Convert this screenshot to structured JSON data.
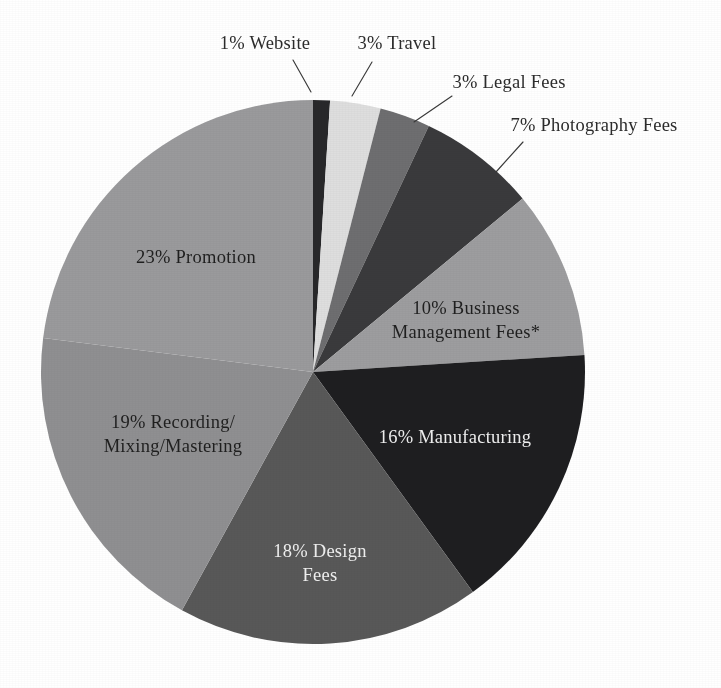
{
  "figure": {
    "background_color": "#ffffff",
    "width": 721,
    "height": 688
  },
  "pie_geometry": {
    "center_x": 313,
    "center_y": 372,
    "radius": 272,
    "start_angle_deg": 0,
    "direction": "clockwise"
  },
  "chart_data": {
    "type": "pie",
    "title": "",
    "subtitle": "",
    "xlabel": "",
    "ylabel": "",
    "legend_position": "none",
    "grid": false,
    "units": "percent",
    "total": 100,
    "footnote_marker": "*",
    "categories": [
      "Website",
      "Travel",
      "Legal Fees",
      "Photography Fees",
      "Business Management Fees*",
      "Manufacturing",
      "Design Fees",
      "Recording/Mixing/Mastering",
      "Promotion"
    ],
    "values": [
      1,
      3,
      3,
      7,
      10,
      16,
      18,
      19,
      23
    ],
    "colors": [
      "#28282a",
      "#dedede",
      "#6e6e70",
      "#3a3a3c",
      "#9d9d9f",
      "#1e1e20",
      "#585858",
      "#8f8f91",
      "#9a9a9c"
    ],
    "slices": [
      {
        "label": "Website",
        "value": 1,
        "value_text": "1%",
        "full_label": "1% Website",
        "color": "#28282a",
        "label_placement": "outside",
        "label_lines": [
          "1% Website"
        ],
        "label_x": 265,
        "label_y": 45,
        "label_anchor": "middle",
        "leader": {
          "x1": 293,
          "y1": 60,
          "x2": 311,
          "y2": 92
        }
      },
      {
        "label": "Travel",
        "value": 3,
        "value_text": "3%",
        "full_label": "3% Travel",
        "color": "#dedede",
        "label_placement": "outside",
        "label_lines": [
          "3% Travel"
        ],
        "label_x": 397,
        "label_y": 45,
        "label_anchor": "middle",
        "leader": {
          "x1": 372,
          "y1": 62,
          "x2": 352,
          "y2": 96
        }
      },
      {
        "label": "Legal Fees",
        "value": 3,
        "value_text": "3%",
        "full_label": "3% Legal Fees",
        "color": "#6e6e70",
        "label_placement": "outside",
        "label_lines": [
          "3% Legal Fees"
        ],
        "label_x": 509,
        "label_y": 84,
        "label_anchor": "middle",
        "leader": {
          "x1": 452,
          "y1": 96,
          "x2": 414,
          "y2": 122
        }
      },
      {
        "label": "Photography Fees",
        "value": 7,
        "value_text": "7%",
        "full_label": "7% Photography Fees",
        "color": "#3a3a3c",
        "label_placement": "outside",
        "label_lines": [
          "7% Photography Fees"
        ],
        "label_x": 594,
        "label_y": 127,
        "label_anchor": "middle",
        "leader": {
          "x1": 523,
          "y1": 142,
          "x2": 496,
          "y2": 172
        }
      },
      {
        "label": "Business Management Fees*",
        "value": 10,
        "value_text": "10%",
        "full_label": "10% Business Management Fees*",
        "color": "#9d9d9f",
        "label_placement": "inside",
        "label_color": "#1f1f1f",
        "label_lines": [
          "10% Business",
          "Management Fees*"
        ],
        "label_x": 466,
        "label_y": 310,
        "label_anchor": "middle"
      },
      {
        "label": "Manufacturing",
        "value": 16,
        "value_text": "16%",
        "full_label": "16% Manufacturing",
        "color": "#1e1e20",
        "label_placement": "inside",
        "label_color": "#efefef",
        "label_lines": [
          "16% Manufacturing"
        ],
        "label_x": 455,
        "label_y": 439,
        "label_anchor": "middle"
      },
      {
        "label": "Design Fees",
        "value": 18,
        "value_text": "18%",
        "full_label": "18% Design Fees",
        "color": "#585858",
        "label_placement": "inside",
        "label_color": "#efefef",
        "label_lines": [
          "18% Design",
          "Fees"
        ],
        "label_x": 320,
        "label_y": 553,
        "label_anchor": "middle"
      },
      {
        "label": "Recording/Mixing/Mastering",
        "value": 19,
        "value_text": "19%",
        "full_label": "19% Recording/Mixing/Mastering",
        "color": "#8f8f91",
        "label_placement": "inside",
        "label_color": "#1f1f1f",
        "label_lines": [
          "19% Recording/",
          "Mixing/Mastering"
        ],
        "label_x": 173,
        "label_y": 424,
        "label_anchor": "middle"
      },
      {
        "label": "Promotion",
        "value": 23,
        "value_text": "23%",
        "full_label": "23% Promotion",
        "color": "#9a9a9c",
        "label_placement": "inside",
        "label_color": "#1f1f1f",
        "label_lines": [
          "23% Promotion"
        ],
        "label_x": 196,
        "label_y": 259,
        "label_anchor": "middle"
      }
    ]
  }
}
